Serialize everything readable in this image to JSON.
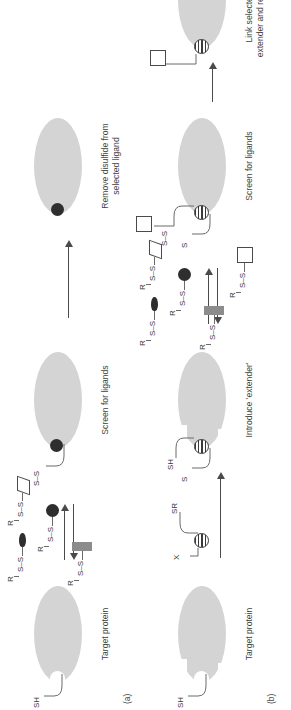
{
  "figure": {
    "type": "schematic-diagram",
    "orientation": "rotated-90-ccw",
    "colors": {
      "protein_fill": "#d4d4d4",
      "ligand_dark": "#2e2e2e",
      "ligand_gray": "#8c8c8c",
      "ligand_open": "#ffffff",
      "line": "#4a4a4a",
      "text": "#3a3a3a"
    }
  },
  "panels": [
    {
      "id": "a",
      "label": "(a)",
      "steps": [
        {
          "caption": "Target protein"
        },
        {
          "caption": "Screen for ligands"
        },
        {
          "caption": "Remove disulfide from\nselected ligand"
        }
      ],
      "captions": {
        "target": "Target protein",
        "screen": "Screen for ligands",
        "remove_line1": "Remove disulfide from",
        "remove_line2": "selected ligand"
      },
      "thiol_label": "SH",
      "bound_ligand_label": "S–S",
      "library": {
        "residue_label": "R",
        "disulfide_label": "S–S",
        "members": [
          {
            "shape": "teardrop",
            "tag": "R",
            "linker": "S–S"
          },
          {
            "shape": "parallelogram",
            "tag": "R",
            "linker": "S–S"
          },
          {
            "shape": "circle-dark",
            "tag": "R",
            "linker": "S–S"
          },
          {
            "shape": "rect-gray",
            "tag": "R",
            "linker": "S–S"
          }
        ]
      }
    },
    {
      "id": "b",
      "label": "(b)",
      "steps": [
        {
          "caption": "Target protein"
        },
        {
          "caption": "Introduce 'extender'"
        },
        {
          "caption": "Screen for ligands"
        },
        {
          "caption": "Link selected ligand to\nextender and replace disulfide"
        }
      ],
      "captions": {
        "target": "Target protein",
        "extender": "Introduce 'extender'",
        "screen": "Screen for ligands",
        "link_line1": "Link selected ligand to",
        "link_line2": "extender and replace disulfide"
      },
      "thiol_label": "SH",
      "reagent": {
        "left_label": "X",
        "right_label": "SR",
        "shape": "striped-circle"
      },
      "extender_bound": {
        "protein_link": "S",
        "free_thiol": "SH"
      },
      "screen_complex": {
        "protein_link": "S",
        "extender_link": "S–S",
        "ligand_shape": "square-open"
      },
      "library": {
        "residue_label": "R",
        "disulfide_label": "S–S",
        "members": [
          {
            "shape": "teardrop",
            "tag": "R",
            "linker": "S–S"
          },
          {
            "shape": "parallelogram",
            "tag": "R",
            "linker": "S–S"
          },
          {
            "shape": "circle-dark",
            "tag": "R",
            "linker": "S–S"
          },
          {
            "shape": "rect-gray",
            "tag": "R",
            "linker": "S–S"
          },
          {
            "shape": "square-open",
            "tag": "R",
            "linker": "S–S"
          }
        ]
      }
    }
  ]
}
